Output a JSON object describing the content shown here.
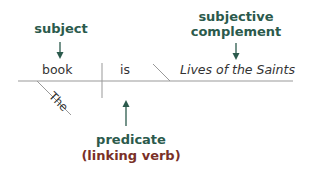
{
  "diagram": {
    "type": "sentence-diagram",
    "sentence": "The book is Lives of the Saints",
    "words": {
      "subject": "book",
      "verb": "is",
      "complement": "Lives of the Saints",
      "modifier": "The"
    },
    "labels": {
      "subject": "subject",
      "complement_line1": "subjective",
      "complement_line2": "complement",
      "predicate": "predicate",
      "predicate_note": "(linking verb)"
    },
    "colors": {
      "label_green": "#2b5a4c",
      "label_brown": "#7a3027",
      "line": "#888888",
      "text": "#333333"
    }
  }
}
